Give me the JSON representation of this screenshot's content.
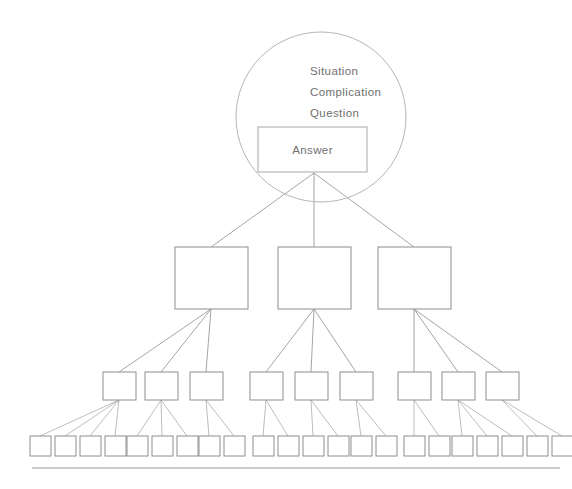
{
  "diagram": {
    "type": "hierarchy-pyramid",
    "background_color": "#ffffff",
    "line_color": "#8e8e8e",
    "text_color": "#6f6f6f",
    "top_circle": {
      "name": "scqa-circle",
      "center_x": 321,
      "center_y": 117,
      "radius": 85,
      "labels": [
        {
          "text": "Situation",
          "x": 310,
          "y": 75
        },
        {
          "text": "Complication",
          "x": 310,
          "y": 96
        },
        {
          "text": "Question",
          "x": 310,
          "y": 117
        }
      ],
      "answer_box": {
        "label": "Answer",
        "x": 258,
        "y": 127,
        "width": 109,
        "height": 45
      }
    },
    "level_two": {
      "label": "",
      "y": 247,
      "height": 62,
      "boxes": [
        {
          "label": "",
          "x": 175,
          "width": 73
        },
        {
          "label": "",
          "x": 278,
          "width": 73
        },
        {
          "label": "",
          "x": 378,
          "width": 73
        }
      ]
    },
    "level_three": {
      "label": "",
      "y": 372,
      "height": 28,
      "boxes": [
        {
          "label": "",
          "x": 103,
          "width": 33
        },
        {
          "label": "",
          "x": 145,
          "width": 33
        },
        {
          "label": "",
          "x": 190,
          "width": 33
        },
        {
          "label": "",
          "x": 250,
          "width": 33
        },
        {
          "label": "",
          "x": 295,
          "width": 33
        },
        {
          "label": "",
          "x": 340,
          "width": 33
        },
        {
          "label": "",
          "x": 398,
          "width": 33
        },
        {
          "label": "",
          "x": 442,
          "width": 33
        },
        {
          "label": "",
          "x": 486,
          "width": 33
        }
      ]
    },
    "level_four": {
      "label": "",
      "y": 436,
      "height": 20,
      "groups": [
        {
          "parent": 0,
          "boxes": [
            {
              "x": 30
            },
            {
              "x": 55
            },
            {
              "x": 80
            },
            {
              "x": 105
            }
          ]
        },
        {
          "parent": 1,
          "boxes": [
            {
              "x": 127
            },
            {
              "x": 152
            },
            {
              "x": 177
            }
          ]
        },
        {
          "parent": 2,
          "boxes": [
            {
              "x": 199
            },
            {
              "x": 224
            }
          ]
        },
        {
          "parent": 3,
          "boxes": [
            {
              "x": 253
            },
            {
              "x": 278
            }
          ]
        },
        {
          "parent": 4,
          "boxes": [
            {
              "x": 303
            },
            {
              "x": 328
            }
          ]
        },
        {
          "parent": 5,
          "boxes": [
            {
              "x": 351
            },
            {
              "x": 376
            }
          ]
        },
        {
          "parent": 6,
          "boxes": [
            {
              "x": 404
            },
            {
              "x": 429
            }
          ]
        },
        {
          "parent": 7,
          "boxes": [
            {
              "x": 452
            },
            {
              "x": 477
            },
            {
              "x": 502
            }
          ]
        },
        {
          "parent": 8,
          "boxes": [
            {
              "x": 527
            },
            {
              "x": 552
            }
          ]
        }
      ],
      "box_width": 21
    },
    "baseline": {
      "name": "baseline-rule",
      "x1": 32,
      "x2": 560,
      "y": 468
    }
  }
}
